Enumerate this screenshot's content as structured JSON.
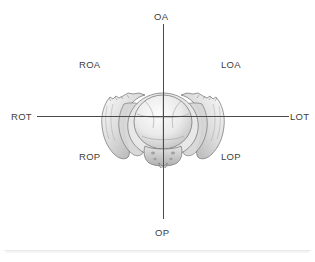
{
  "axes": {
    "vertical_name": "anterior-posterior-axis",
    "horizontal_name": "transverse-axis",
    "color": "#4a4a4a"
  },
  "labels": {
    "oa": "OA",
    "op": "OP",
    "rot": "ROT",
    "lot": "LOT",
    "roa": "ROA",
    "loa": "LOA",
    "rop": "ROP",
    "lop": "LOP"
  },
  "illustration": {
    "name": "pelvis-with-fetal-head",
    "alt": "Grayscale anatomical drawing of the bony pelvis viewed from above with the fetal skull in the pelvic inlet",
    "colors": {
      "bone_light": "#f2f2f2",
      "bone_mid": "#c9c9c9",
      "bone_shadow": "#8f8f8f",
      "outline": "#6e6e6e",
      "skull_fill": "#ededed",
      "suture": "#9a9a9a"
    }
  },
  "divider": {
    "name": "bottom-divider",
    "color": "#e9e9e9"
  }
}
